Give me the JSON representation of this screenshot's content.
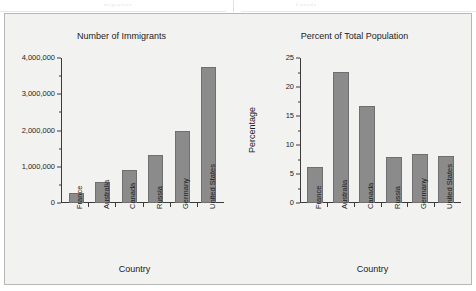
{
  "page": {
    "background_color": "#ffffff",
    "frame_border_color": "#b7b7b7",
    "figure_background_color": "#f2f2f1",
    "artifact_left": "migration",
    "artifact_right": "Canada"
  },
  "chart_data": [
    {
      "type": "bar",
      "panel": "left",
      "title": "Number of Immigrants",
      "xlabel": "Country",
      "ylabel": "",
      "categories": [
        "France",
        "Australia",
        "Canada",
        "Russia",
        "Germany",
        "United States"
      ],
      "values": [
        270000,
        580000,
        900000,
        1320000,
        1980000,
        3750000
      ],
      "ylim": [
        0,
        4000000
      ],
      "ytick_values": [
        0,
        1000000,
        2000000,
        3000000,
        4000000
      ],
      "ytick_labels": [
        "0",
        "1,000,000",
        "2,000,000",
        "3,000,000",
        "4,000,000"
      ],
      "yminor_tick_values": [
        500000,
        1500000,
        2500000,
        3500000
      ],
      "grid": false,
      "legend": "none",
      "bar_color": "#8b8b8b",
      "bar_edge_color": "#6f6f6f"
    },
    {
      "type": "bar",
      "panel": "right",
      "title": "Percent of Total Population",
      "xlabel": "Country",
      "ylabel": "Percentage",
      "categories": [
        "France",
        "Australia",
        "Canada",
        "Russia",
        "Germany",
        "United States"
      ],
      "values": [
        6.2,
        22.6,
        16.8,
        8.0,
        8.4,
        8.1
      ],
      "ylim": [
        0,
        25
      ],
      "ytick_values": [
        0,
        5,
        10,
        15,
        20,
        25
      ],
      "ytick_labels": [
        "0",
        "5",
        "10",
        "15",
        "20",
        "25"
      ],
      "yminor_tick_values": [
        2.5,
        7.5,
        12.5,
        17.5,
        22.5
      ],
      "grid": false,
      "legend": "none",
      "bar_color": "#8b8b8b",
      "bar_edge_color": "#6f6f6f"
    }
  ]
}
